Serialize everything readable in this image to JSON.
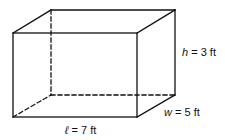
{
  "diagram": {
    "type": "rectangular-prism",
    "colors": {
      "stroke": "#111111",
      "background": "#ffffff"
    },
    "vertices": {
      "front_top_left": [
        13,
        33
      ],
      "front_top_right": [
        137,
        33
      ],
      "front_bottom_left": [
        13,
        117
      ],
      "front_bottom_right": [
        137,
        117
      ],
      "back_top_left": [
        51,
        10
      ],
      "back_top_right": [
        175,
        10
      ],
      "back_bottom_left": [
        51,
        95
      ],
      "back_bottom_right": [
        175,
        95
      ]
    },
    "labels": {
      "height": {
        "var": "h",
        "rest": " = 3 ft"
      },
      "width": {
        "var": "w",
        "rest": " = 5 ft"
      },
      "length": {
        "var": "ℓ",
        "rest": " = 7 ft"
      }
    }
  }
}
